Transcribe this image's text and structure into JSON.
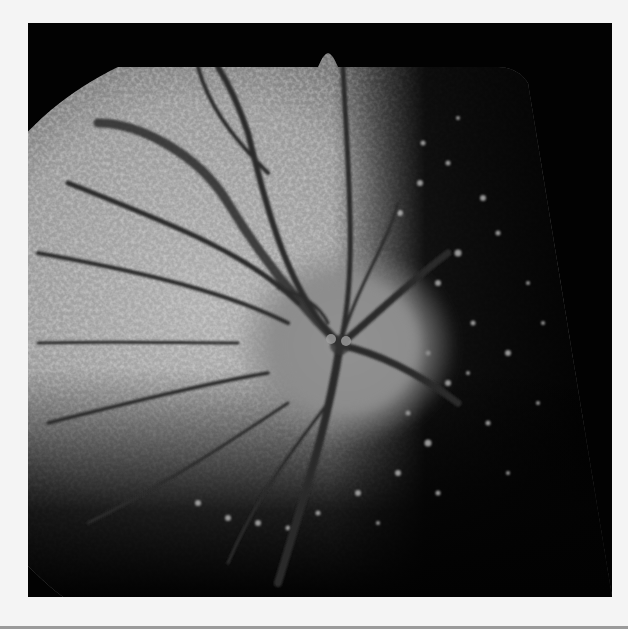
{
  "image": {
    "kind": "fundus-autofluorescence-photograph",
    "description": "Grayscale retinal fundus image with optic disc at center, dark retinal vessels radiating outward, mottled bright hyperautofluorescent retina on left and atrophic dark region with scattered bright flecks on right",
    "colors": {
      "page_background": "#f4f4f4",
      "frame": "#020202",
      "retina_bright": "#a8a8a8",
      "retina_mid": "#7a7a7a",
      "disc": "#8c8c8c",
      "vessel": "#2a2a2a"
    }
  }
}
